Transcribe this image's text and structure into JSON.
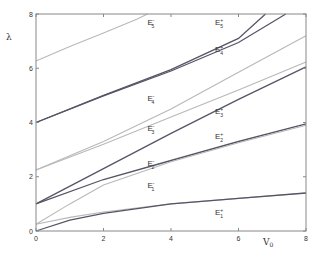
{
  "chart_data": {
    "type": "line",
    "title": "",
    "xlabel": "V0",
    "ylabel": "λ",
    "xlim": [
      0,
      8
    ],
    "ylim": [
      0,
      8
    ],
    "xticks": [
      0,
      2,
      4,
      6,
      8
    ],
    "yticks": [
      0,
      2,
      4,
      6,
      8
    ],
    "grid": false,
    "legend": "none (inline curve labels)",
    "colors": {
      "plus": "#555566",
      "minus": "#b8b8b8",
      "axis": "#888888"
    },
    "series": [
      {
        "name": "E5-",
        "style": "minus",
        "x": [
          0,
          1,
          2,
          3,
          3.3
        ],
        "y": [
          6.27,
          6.8,
          7.3,
          7.82,
          8.0
        ],
        "label_pos": [
          3.3,
          7.6
        ]
      },
      {
        "name": "E5+",
        "style": "plus",
        "x": [
          0,
          2,
          4,
          6,
          6.8
        ],
        "y": [
          4.0,
          5.0,
          5.95,
          7.1,
          8.0
        ],
        "label_pos": [
          5.3,
          7.6
        ]
      },
      {
        "name": "E4+",
        "style": "plus",
        "x": [
          0,
          2,
          4,
          6,
          7.4
        ],
        "y": [
          4.0,
          4.98,
          5.9,
          6.95,
          8.0
        ],
        "label_pos": [
          5.3,
          6.6
        ]
      },
      {
        "name": "E4-",
        "style": "minus",
        "x": [
          0,
          2,
          4,
          6,
          8
        ],
        "y": [
          2.25,
          3.3,
          4.5,
          5.85,
          7.2
        ],
        "label_pos": [
          3.3,
          4.8
        ]
      },
      {
        "name": "E3-",
        "style": "minus",
        "x": [
          0,
          2,
          4,
          6,
          8
        ],
        "y": [
          2.25,
          3.2,
          4.2,
          5.2,
          6.23
        ],
        "label_pos": [
          3.3,
          3.7
        ]
      },
      {
        "name": "E3+",
        "style": "plus",
        "x": [
          0,
          2,
          4,
          6,
          8
        ],
        "y": [
          1.0,
          2.3,
          3.6,
          4.85,
          6.05
        ],
        "label_pos": [
          5.3,
          4.3
        ]
      },
      {
        "name": "E2+",
        "style": "plus",
        "x": [
          0,
          2,
          4,
          6,
          8
        ],
        "y": [
          1.0,
          1.9,
          2.6,
          3.3,
          3.95
        ],
        "label_pos": [
          5.3,
          3.4
        ]
      },
      {
        "name": "E2-",
        "style": "minus",
        "x": [
          0,
          1,
          2,
          4,
          6,
          8
        ],
        "y": [
          0.25,
          1.0,
          1.7,
          2.55,
          3.25,
          3.9
        ],
        "label_pos": [
          3.3,
          2.4
        ]
      },
      {
        "name": "E1-",
        "style": "minus",
        "x": [
          0,
          1,
          2,
          4,
          6,
          8
        ],
        "y": [
          0.25,
          0.5,
          0.7,
          1.0,
          1.2,
          1.4
        ],
        "label_pos": [
          3.3,
          1.6
        ]
      },
      {
        "name": "E1+",
        "style": "plus",
        "x": [
          0,
          1,
          2,
          4,
          6,
          8
        ],
        "y": [
          0.0,
          0.4,
          0.65,
          1.0,
          1.2,
          1.4
        ],
        "label_pos": [
          5.3,
          0.6
        ]
      }
    ],
    "labels": [
      {
        "id": "E5-",
        "base": "E",
        "sup": "-",
        "sub": "5"
      },
      {
        "id": "E5+",
        "base": "E",
        "sup": "+",
        "sub": "5"
      },
      {
        "id": "E4+",
        "base": "E",
        "sup": "+",
        "sub": "4"
      },
      {
        "id": "E4-",
        "base": "E",
        "sup": "-",
        "sub": "4"
      },
      {
        "id": "E3-",
        "base": "E",
        "sup": "-",
        "sub": "3"
      },
      {
        "id": "E3+",
        "base": "E",
        "sup": "+",
        "sub": "3"
      },
      {
        "id": "E2+",
        "base": "E",
        "sup": "+",
        "sub": "2"
      },
      {
        "id": "E2-",
        "base": "E",
        "sup": "-",
        "sub": "2"
      },
      {
        "id": "E1-",
        "base": "E",
        "sup": "-",
        "sub": "1"
      },
      {
        "id": "E1+",
        "base": "E",
        "sup": "+",
        "sub": "1"
      }
    ]
  },
  "axes": {
    "x_label": "V",
    "x_label_sub": "0",
    "y_label": "λ",
    "x_ticks": [
      "0",
      "2",
      "4",
      "6",
      "8"
    ],
    "y_ticks": [
      "0",
      "2",
      "4",
      "6",
      "8"
    ]
  }
}
